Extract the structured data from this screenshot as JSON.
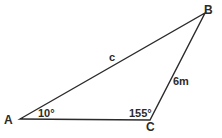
{
  "diagram": {
    "type": "triangle",
    "vertices": [
      {
        "id": "A",
        "label": "A",
        "x": 20,
        "y": 119
      },
      {
        "id": "B",
        "label": "B",
        "x": 205,
        "y": 13
      },
      {
        "id": "C",
        "label": "C",
        "x": 150,
        "y": 120
      }
    ],
    "sides": [
      {
        "from": "A",
        "to": "B",
        "label": "c"
      },
      {
        "from": "B",
        "to": "C",
        "label": "6m"
      },
      {
        "from": "A",
        "to": "C",
        "label": ""
      }
    ],
    "angles": [
      {
        "at": "A",
        "label": "10°"
      },
      {
        "at": "C",
        "label": "155°"
      }
    ],
    "colors": {
      "stroke": "#2b2b2b",
      "background": "#ffffff"
    }
  }
}
